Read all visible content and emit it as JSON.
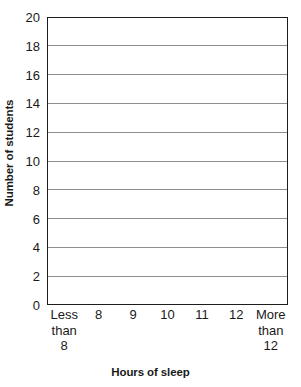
{
  "chart_data": {
    "type": "bar",
    "title": "",
    "subtitle": "",
    "xlabel": "Hours of sleep",
    "ylabel": "Number of students",
    "categories": [
      "Less\nthan\n8",
      "8",
      "9",
      "10",
      "11",
      "12",
      "More\nthan\n12"
    ],
    "values": [
      null,
      null,
      null,
      null,
      null,
      null,
      null
    ],
    "series": [],
    "ylim": [
      0,
      20
    ],
    "ytick_step": 2,
    "ytick_labels": [
      "0",
      "2",
      "4",
      "6",
      "8",
      "10",
      "12",
      "14",
      "16",
      "18",
      "20"
    ],
    "grid": "horizontal",
    "legend": "none",
    "annotations": [],
    "note": "Blank grid template — no data plotted in the axes area."
  },
  "colors": {
    "axis": "#1d1d1d",
    "gridline": "#8e8e8e",
    "plot_background": "#ffffff",
    "text": "#1a1a1a",
    "page_background": "#ffffff"
  }
}
